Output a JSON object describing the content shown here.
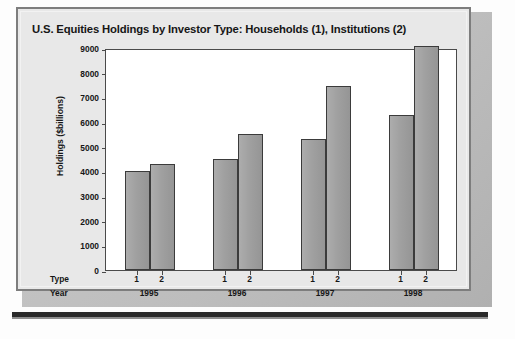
{
  "chart_data": {
    "type": "bar",
    "title": "U.S. Equities Holdings by Investor Type: Households (1), Institutions (2)",
    "xlabel": "",
    "ylabel": "Holdings ($billions)",
    "ylim": [
      0,
      9000
    ],
    "yticks": [
      0,
      1000,
      2000,
      3000,
      4000,
      5000,
      6000,
      7000,
      8000,
      9000
    ],
    "grid": false,
    "legend": "none",
    "group_axis_labels": {
      "type_row": "Type",
      "year_row": "Year"
    },
    "categories": [
      "1995",
      "1996",
      "1997",
      "1998"
    ],
    "subcategories": [
      "1",
      "2"
    ],
    "series": [
      {
        "name": "1",
        "label": "Households (1)",
        "values": [
          4000,
          4500,
          5300,
          6300
        ]
      },
      {
        "name": "2",
        "label": "Institutions (2)",
        "values": [
          4300,
          5500,
          7450,
          9100
        ]
      }
    ],
    "bars": [
      {
        "year": "1995",
        "type": "1",
        "value": 4000
      },
      {
        "year": "1995",
        "type": "2",
        "value": 4300
      },
      {
        "year": "1996",
        "type": "1",
        "value": 4500
      },
      {
        "year": "1996",
        "type": "2",
        "value": 5500
      },
      {
        "year": "1997",
        "type": "1",
        "value": 5300
      },
      {
        "year": "1997",
        "type": "2",
        "value": 7450
      },
      {
        "year": "1998",
        "type": "1",
        "value": 6300
      },
      {
        "year": "1998",
        "type": "2",
        "value": 9100
      }
    ],
    "colors": {
      "bar_fill": "#9d9d9d",
      "bar_edge": "#3b3b3b",
      "plot_background": "#ffffff",
      "card_background": "#e8e8e8",
      "axis": "#4a4a4a",
      "text": "#161616"
    }
  }
}
